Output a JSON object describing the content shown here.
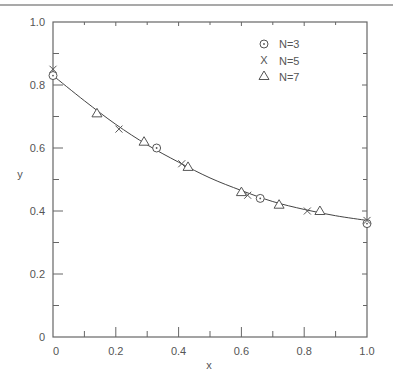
{
  "chart_data": {
    "type": "line",
    "title": "",
    "xlabel": "x",
    "ylabel": "y",
    "xlim": [
      0,
      1.0
    ],
    "ylim": [
      0,
      1.0
    ],
    "grid": false,
    "legend_position": "upper right (inside)",
    "x_ticks": [
      "0",
      "0.2",
      "0.4",
      "0.6",
      "0.8",
      "1.0"
    ],
    "y_ticks": [
      "0",
      "0.2",
      "0.4",
      "0.6",
      "0.8",
      "1.0"
    ],
    "curve": {
      "name": "fitted curve",
      "x": [
        0,
        0.1,
        0.2,
        0.3,
        0.4,
        0.5,
        0.6,
        0.7,
        0.8,
        0.9,
        1.0
      ],
      "y": [
        0.83,
        0.75,
        0.675,
        0.61,
        0.555,
        0.505,
        0.465,
        0.43,
        0.405,
        0.385,
        0.37
      ]
    },
    "series": [
      {
        "name": "N=3",
        "marker": "circle-dot",
        "x": [
          0,
          0.33,
          0.66,
          1.0
        ],
        "y": [
          0.83,
          0.6,
          0.44,
          0.36
        ]
      },
      {
        "name": "N=5",
        "marker": "x",
        "x": [
          0,
          0.21,
          0.41,
          0.62,
          0.81,
          1.0
        ],
        "y": [
          0.85,
          0.66,
          0.55,
          0.45,
          0.4,
          0.37
        ]
      },
      {
        "name": "N=7",
        "marker": "triangle",
        "x": [
          0.14,
          0.29,
          0.43,
          0.6,
          0.72,
          0.85
        ],
        "y": [
          0.71,
          0.62,
          0.54,
          0.46,
          0.42,
          0.4
        ]
      }
    ]
  },
  "legend": {
    "items": [
      {
        "label": "N=3",
        "marker": "circle-dot"
      },
      {
        "label": "N=5",
        "marker": "x"
      },
      {
        "label": "N=7",
        "marker": "triangle"
      }
    ]
  },
  "axes": {
    "xlabel": "x",
    "ylabel": "y"
  },
  "colors": {
    "axis": "#666666",
    "line": "#444444",
    "marker": "#555555",
    "text": "#555555",
    "top_rule": "#a9a9a9"
  }
}
